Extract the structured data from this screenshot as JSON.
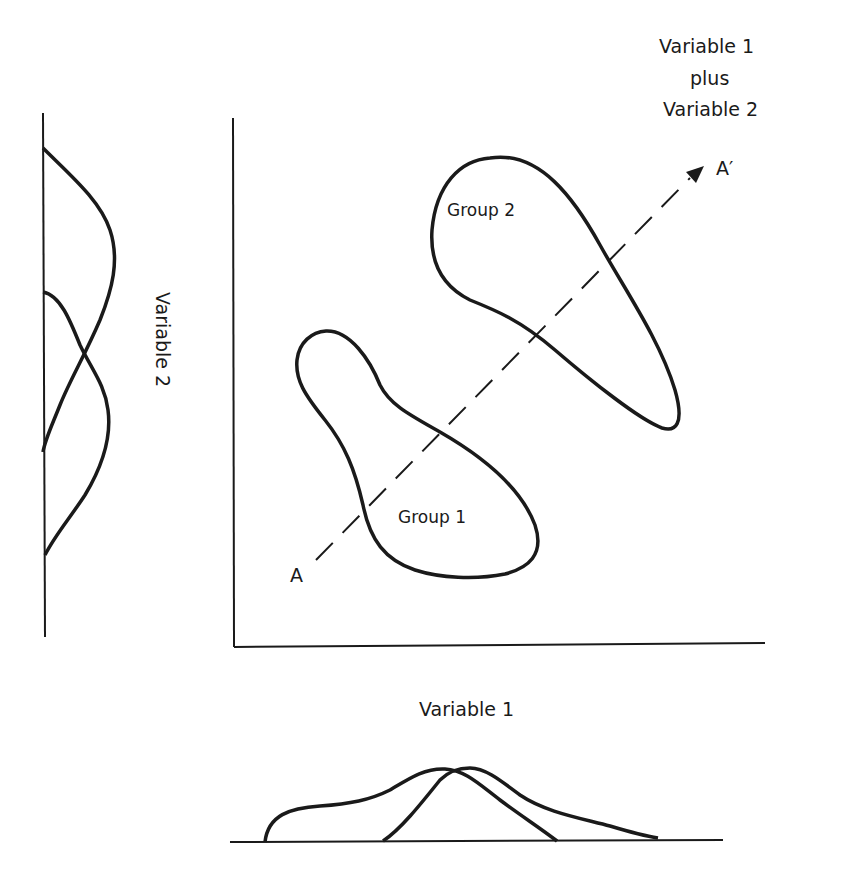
{
  "figure": {
    "title_combined_axis": {
      "line1": "Variable 1",
      "line2": "plus",
      "line3": "Variable 2"
    },
    "y_axis_label": "Variable 2",
    "x_axis_label": "Variable 1",
    "groups": [
      {
        "label": "Group 1"
      },
      {
        "label": "Group 2"
      }
    ],
    "discriminant_axis": {
      "start_label": "A",
      "end_label": "A′",
      "style": "dashed-arrow"
    },
    "stroke_color": "#1a1a1a",
    "background_color": "#ffffff"
  }
}
